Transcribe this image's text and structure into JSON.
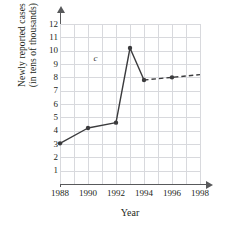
{
  "chart_data": {
    "type": "line",
    "title": "",
    "xlabel": "Year",
    "ylabel_line1": "Newly reported cases",
    "ylabel_line2": "(in tens of thousands)",
    "xlim": [
      1988,
      1998
    ],
    "ylim": [
      0,
      12
    ],
    "grid": true,
    "legend": "none",
    "x_tick_labels": [
      "1988",
      "1990",
      "1992",
      "1994",
      "1996",
      "1998"
    ],
    "x_tick_values": [
      1988,
      1990,
      1992,
      1994,
      1996,
      1998
    ],
    "y_tick_labels": [
      "1",
      "2",
      "3",
      "4",
      "5",
      "6",
      "7",
      "8",
      "9",
      "10",
      "11",
      "12"
    ],
    "y_tick_values": [
      1,
      2,
      3,
      4,
      5,
      6,
      7,
      8,
      9,
      10,
      11,
      12
    ],
    "annotations": [
      {
        "text": "c",
        "x": 1990.6,
        "y": 9.45,
        "style": "italic"
      }
    ],
    "series": [
      {
        "name": "reported-cases-observed",
        "style": "solid",
        "marker": "filled-circle",
        "color": "#3b3b3d",
        "x": [
          1988,
          1990,
          1992,
          1993,
          1994
        ],
        "values": [
          3.05,
          4.2,
          4.6,
          10.2,
          7.8
        ]
      },
      {
        "name": "reported-cases-projected",
        "style": "dashed",
        "marker": "filled-circle",
        "color": "#3b3b3d",
        "x": [
          1994,
          1996,
          1998
        ],
        "values": [
          7.8,
          8.0,
          8.2
        ],
        "markers_at": [
          1996
        ]
      }
    ]
  }
}
